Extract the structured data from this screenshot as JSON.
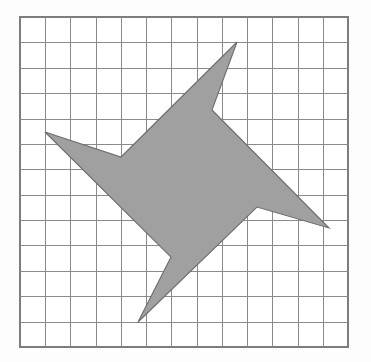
{
  "figure": {
    "background_color": "#fdfdfd",
    "grid": {
      "name": "square-grid",
      "columns": 13,
      "rows": 13,
      "cell_width_px": 25.23,
      "cell_height_px": 25.38,
      "origin_x_px": 20,
      "origin_y_px": 17,
      "width_px": 328,
      "height_px": 330,
      "line_color": "#8a8a8a",
      "border_color": "#7d7d7d",
      "cell_fill_color": "#ffffff",
      "line_width_px": 1
    },
    "shape": {
      "name": "star-polygon",
      "type": "polygon",
      "point_count": 8,
      "spike_count": 4,
      "fill_color": "#a0a0a0",
      "stroke_color": "#6e6e6e",
      "stroke_width_px": 1.1,
      "vertices_px": [
        [
          237,
          42
        ],
        [
          212,
          110
        ],
        [
          329,
          228
        ],
        [
          257,
          207
        ],
        [
          138,
          322
        ],
        [
          171,
          257
        ],
        [
          45,
          132
        ],
        [
          121,
          157
        ]
      ],
      "vertices_grid_units": [
        [
          8.6,
          1.0
        ],
        [
          7.6,
          3.67
        ],
        [
          12.25,
          8.31
        ],
        [
          9.4,
          7.49
        ],
        [
          4.68,
          12.02
        ],
        [
          5.99,
          9.46
        ],
        [
          0.99,
          4.53
        ],
        [
          4.0,
          5.51
        ]
      ],
      "vertex_labels": [
        "top-spike-tip",
        "notch-top-right",
        "right-spike-tip",
        "notch-bottom-right",
        "bottom-spike-tip",
        "notch-bottom-left",
        "left-spike-tip",
        "notch-top-left"
      ]
    }
  },
  "chart_data": {
    "type": "scatter",
    "xlabel": "",
    "ylabel": "",
    "xlim": [
      0,
      13
    ],
    "ylim": [
      0,
      13
    ],
    "grid": true,
    "legend": "none",
    "series": [
      {
        "name": "star-polygon",
        "x": [
          8.6,
          7.6,
          12.25,
          9.4,
          4.68,
          5.99,
          0.99,
          4.0
        ],
        "y": [
          1.0,
          3.67,
          8.31,
          7.49,
          12.02,
          9.46,
          4.53,
          5.51
        ]
      }
    ]
  }
}
